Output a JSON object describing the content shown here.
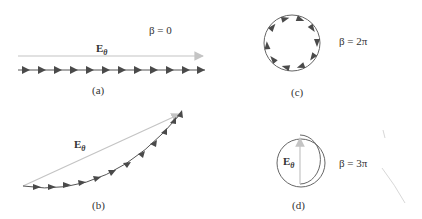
{
  "figure": {
    "panels": [
      {
        "id": "a",
        "caption": "(a)",
        "vector_label": "E",
        "vector_sub": "θ",
        "beta_label": "β = 0"
      },
      {
        "id": "b",
        "caption": "(b)",
        "vector_label": "E",
        "vector_sub": "θ"
      },
      {
        "id": "c",
        "caption": "(c)",
        "beta_label": "β = 2π"
      },
      {
        "id": "d",
        "caption": "(d)",
        "vector_label": "E",
        "vector_sub": "θ",
        "beta_label": "β = 3π"
      }
    ],
    "colors": {
      "resultant": "#c4c4c4",
      "chain": "#555555",
      "arrowhead": "#4a4a4a",
      "circle": "#666666"
    }
  }
}
